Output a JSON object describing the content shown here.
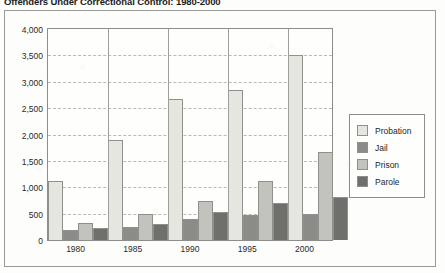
{
  "title": "Offenders Under Correctional Control: 1980-2000",
  "legend": {
    "position": "right",
    "items": [
      {
        "label": "Probation",
        "color": "#e6e6e1",
        "swatch_name": "legend-swatch-probation"
      },
      {
        "label": "Jail",
        "color": "#8b8b88",
        "swatch_name": "legend-swatch-jail"
      },
      {
        "label": "Prison",
        "color": "#c3c3be",
        "swatch_name": "legend-swatch-prison"
      },
      {
        "label": "Parole",
        "color": "#6f6f6c",
        "swatch_name": "legend-swatch-parole"
      }
    ]
  },
  "axis": {
    "y_ticks": [
      "4,000",
      "3,500",
      "3,000",
      "2,500",
      "2,000",
      "1,500",
      "1,000",
      "500",
      "0"
    ],
    "x_ticks": [
      "1980",
      "1985",
      "1990",
      "1995",
      "2000"
    ]
  },
  "chart_data": {
    "type": "bar",
    "title": "Offenders Under Correctional Control: 1980-2000",
    "xlabel": "",
    "ylabel": "",
    "ylim": [
      0,
      4000
    ],
    "ytick_step": 500,
    "grid": true,
    "legend_position": "right",
    "categories": [
      "1980",
      "1985",
      "1990",
      "1995",
      "2000"
    ],
    "series": [
      {
        "name": "Probation",
        "color": "#e6e6e1",
        "values": [
          1110,
          1900,
          2670,
          2840,
          3500
        ]
      },
      {
        "name": "Jail",
        "color": "#8b8b88",
        "values": [
          185,
          255,
          405,
          480,
          500
        ]
      },
      {
        "name": "Prison",
        "color": "#c3c3be",
        "values": [
          330,
          490,
          745,
          1115,
          1660
        ]
      },
      {
        "name": "Parole",
        "color": "#6f6f6c",
        "values": [
          230,
          300,
          530,
          700,
          820
        ]
      }
    ]
  }
}
